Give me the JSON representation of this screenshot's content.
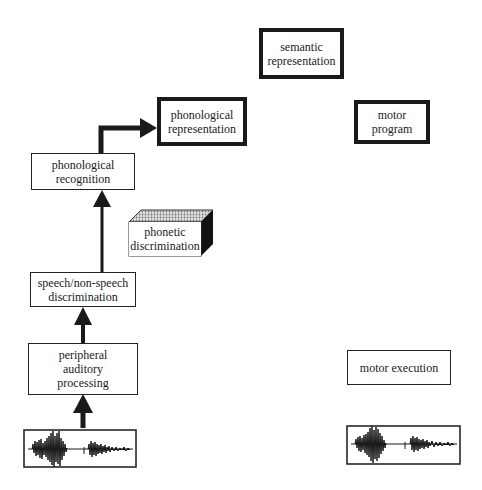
{
  "diagram": {
    "nodes": {
      "semantic_representation": {
        "lines": [
          "semantic",
          "representation"
        ],
        "style": "thick"
      },
      "phonological_representation": {
        "lines": [
          "phonological",
          "representation"
        ],
        "style": "thick"
      },
      "motor_program": {
        "lines": [
          "motor",
          "program"
        ],
        "style": "thick"
      },
      "phonological_recognition": {
        "lines": [
          "phonological",
          "recognition"
        ],
        "style": "thin"
      },
      "phonetic_discrimination": {
        "lines": [
          "phonetic",
          "discrimination"
        ],
        "style": "3d-block"
      },
      "speech_nonspeech_discrimination": {
        "lines": [
          "speech/non-speech",
          "discrimination"
        ],
        "style": "thin"
      },
      "peripheral_auditory_processing": {
        "lines": [
          "peripheral",
          "auditory",
          "processing"
        ],
        "style": "thin"
      },
      "motor_execution": {
        "lines": [
          "motor execution"
        ],
        "style": "thin"
      },
      "input_waveform": {
        "type": "speech-waveform"
      },
      "output_waveform": {
        "type": "speech-waveform"
      }
    },
    "edges": [
      {
        "from": "input_waveform",
        "to": "peripheral_auditory_processing"
      },
      {
        "from": "peripheral_auditory_processing",
        "to": "speech_nonspeech_discrimination"
      },
      {
        "from": "speech_nonspeech_discrimination",
        "to": "phonological_recognition"
      },
      {
        "from": "phonological_recognition",
        "to": "phonological_representation"
      }
    ],
    "colors": {
      "stroke": "#1a1a1a",
      "background": "#ffffff",
      "block_side": "#111111",
      "block_top": "#bdbdbd"
    }
  }
}
